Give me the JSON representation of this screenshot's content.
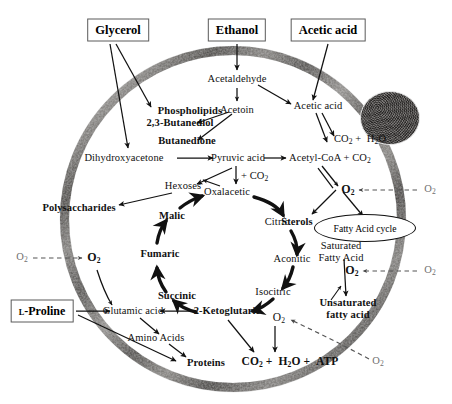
{
  "diagram": {
    "membrane_label": "cell-membrane",
    "nucleus_label": "nucleus-organelle"
  },
  "external_substrates": [
    {
      "id": "glycerol",
      "label": "Glycerol"
    },
    {
      "id": "ethanol",
      "label": "Ethanol"
    },
    {
      "id": "acetic_acid",
      "label": "Acetic acid"
    },
    {
      "id": "l_proline",
      "label_prefix": "L",
      "label_rest": "-Proline",
      "label": "L-Proline"
    }
  ],
  "nodes": {
    "acetaldehyde": "Acetaldehyde",
    "acetoin": "Acetoin",
    "acetic_acid_in": "Acetic acid",
    "phospholipids": "Phospholipids",
    "butanediol": "2,3-Butanediol",
    "butanedione": "Butanedione",
    "dihydroxyacetone": "Dihydroxyacetone",
    "pyruvic_acid": "Pyruvic acid",
    "acetyl_coa": "Acetyl-CoA + CO",
    "acetyl_coa_sub": "2",
    "co2_h2o": "CO",
    "hexoses": "Hexoses",
    "polysaccharides": "Polysaccharides",
    "plus_co2": "+ CO",
    "sterols": "Sterols",
    "fatty_acid_cycle": "Fatty Acid cycle",
    "saturated_l1": "Saturated",
    "saturated_l2": "Fatty Acid",
    "unsaturated_l1": "Unsaturated",
    "unsaturated_l2": "fatty acid",
    "glutamic_acid": "Glutamic acid",
    "amino_acids": "Amino Acids",
    "proteins": "Proteins"
  },
  "tca_cycle": {
    "name": "Tricarboxylic acid cycle",
    "members": [
      {
        "id": "oxalacetic",
        "label": "Oxalacetic",
        "bold": false
      },
      {
        "id": "citric",
        "label": "Citric",
        "bold": false
      },
      {
        "id": "aconitic",
        "label": "Aconitic",
        "bold": false
      },
      {
        "id": "isocitric",
        "label": "Isocitric",
        "bold": false
      },
      {
        "id": "ketoglutaric",
        "label": "2-Ketoglutaric",
        "bold": true
      },
      {
        "id": "succinic",
        "label": "Succinic",
        "bold": true
      },
      {
        "id": "fumaric",
        "label": "Fumaric",
        "bold": true
      },
      {
        "id": "malic",
        "label": "Malic",
        "bold": true
      }
    ]
  },
  "formulas": {
    "co2_h2o": "CO2 + H2O",
    "co2_h2o_atp": "CO2 + H2O + ATP",
    "oxygen": "O2"
  },
  "oxygen_labels": {
    "outside": "O2",
    "inside": "O2",
    "count_outside": 3,
    "count_inside": 4
  },
  "colors": {
    "membrane_dark": "#3d3b39",
    "membrane_mid": "#6d6a66",
    "membrane_light": "#b9b6b2",
    "nucleus": "#4a4745",
    "text": "#111111",
    "box_border": "#5a5a5a",
    "o2_outside": "#6f6f6f"
  }
}
